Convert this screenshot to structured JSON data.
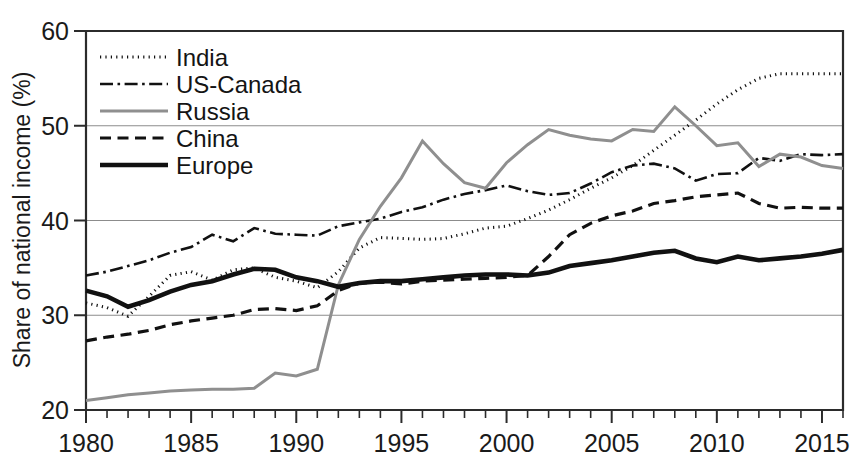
{
  "chart_data": {
    "type": "line",
    "title": "",
    "xlabel": "",
    "ylabel": "Share of national income (%)",
    "xlim": [
      1980,
      2016
    ],
    "ylim": [
      20,
      60
    ],
    "grid": true,
    "legend_position": "top-left",
    "x_ticks": [
      "1980",
      "1985",
      "1990",
      "1995",
      "2000",
      "2005",
      "2010",
      "2015"
    ],
    "x_tick_values": [
      1980,
      1985,
      1990,
      1995,
      2000,
      2005,
      2010,
      2015
    ],
    "y_ticks": [
      "20",
      "30",
      "40",
      "50",
      "60"
    ],
    "y_tick_values": [
      20,
      30,
      40,
      50,
      60
    ],
    "x": [
      1980,
      1981,
      1982,
      1983,
      1984,
      1985,
      1986,
      1987,
      1988,
      1989,
      1990,
      1991,
      1992,
      1993,
      1994,
      1995,
      1996,
      1997,
      1998,
      1999,
      2000,
      2001,
      2002,
      2003,
      2004,
      2005,
      2006,
      2007,
      2008,
      2009,
      2010,
      2011,
      2012,
      2013,
      2014,
      2015,
      2016
    ],
    "series": [
      {
        "name": "India",
        "style": "dotted",
        "color": "#111111",
        "values": [
          31.3,
          30.8,
          29.9,
          32.0,
          34.2,
          34.6,
          33.7,
          34.8,
          35.0,
          34.0,
          33.6,
          32.9,
          34.6,
          37.1,
          38.2,
          38.1,
          38.0,
          38.1,
          38.6,
          39.2,
          39.4,
          40.2,
          41.1,
          42.2,
          43.4,
          44.5,
          45.8,
          47.4,
          49.0,
          50.6,
          52.3,
          53.8,
          55.0,
          55.5,
          55.5,
          55.5,
          55.5
        ]
      },
      {
        "name": "US-Canada",
        "style": "dashdot",
        "color": "#111111",
        "values": [
          34.2,
          34.6,
          35.2,
          35.8,
          36.6,
          37.2,
          38.5,
          37.8,
          39.2,
          38.6,
          38.5,
          38.4,
          39.4,
          39.8,
          40.2,
          40.9,
          41.4,
          42.2,
          42.8,
          43.2,
          43.7,
          43.1,
          42.7,
          42.9,
          43.9,
          45.1,
          45.8,
          46.0,
          45.5,
          44.2,
          44.9,
          45.0,
          46.6,
          46.3,
          47.0,
          46.9,
          47.0
        ]
      },
      {
        "name": "Russia",
        "style": "solid-gray",
        "color": "#8f8f8f",
        "values": [
          21.0,
          21.3,
          21.6,
          21.8,
          22.0,
          22.1,
          22.2,
          22.2,
          22.3,
          23.9,
          23.6,
          24.3,
          33.2,
          38.0,
          41.5,
          44.5,
          48.4,
          46.0,
          44.0,
          43.4,
          46.1,
          48.0,
          49.6,
          49.0,
          48.6,
          48.4,
          49.6,
          49.4,
          52.0,
          50.0,
          47.9,
          48.2,
          45.7,
          47.0,
          46.7,
          45.8,
          45.5
        ]
      },
      {
        "name": "China",
        "style": "dashed",
        "color": "#111111",
        "values": [
          27.3,
          27.7,
          28.0,
          28.4,
          29.0,
          29.4,
          29.7,
          30.0,
          30.6,
          30.7,
          30.5,
          31.0,
          32.6,
          33.4,
          33.5,
          33.3,
          33.6,
          33.7,
          33.8,
          33.9,
          34.0,
          34.2,
          36.2,
          38.5,
          39.7,
          40.5,
          41.0,
          41.8,
          42.1,
          42.5,
          42.7,
          42.9,
          41.8,
          41.3,
          41.4,
          41.3,
          41.3
        ]
      },
      {
        "name": "Europe",
        "style": "solid-black",
        "color": "#111111",
        "values": [
          32.6,
          32.0,
          30.9,
          31.6,
          32.5,
          33.2,
          33.6,
          34.3,
          34.9,
          34.8,
          34.0,
          33.6,
          33.0,
          33.4,
          33.6,
          33.6,
          33.8,
          34.0,
          34.2,
          34.3,
          34.3,
          34.2,
          34.5,
          35.2,
          35.5,
          35.8,
          36.2,
          36.6,
          36.8,
          36.0,
          35.6,
          36.2,
          35.8,
          36.0,
          36.2,
          36.5,
          36.9
        ]
      }
    ]
  },
  "legend": {
    "items": [
      {
        "label": "India",
        "style": "dotted"
      },
      {
        "label": "US-Canada",
        "style": "dashdot"
      },
      {
        "label": "Russia",
        "style": "solid-gray"
      },
      {
        "label": "China",
        "style": "dashed"
      },
      {
        "label": "Europe",
        "style": "solid-black"
      }
    ]
  }
}
